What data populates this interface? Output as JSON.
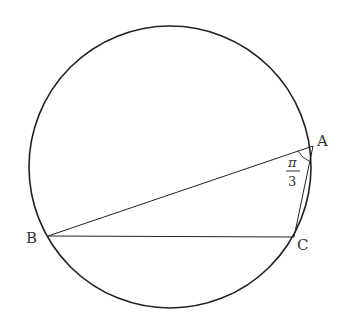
{
  "diagram": {
    "points": {
      "A": {
        "label": "A"
      },
      "B": {
        "label": "B"
      },
      "C": {
        "label": "C"
      }
    },
    "angle_label": {
      "numerator": "π",
      "denominator": "3"
    },
    "colors": {
      "stroke": "#222222",
      "text": "#333333"
    }
  }
}
